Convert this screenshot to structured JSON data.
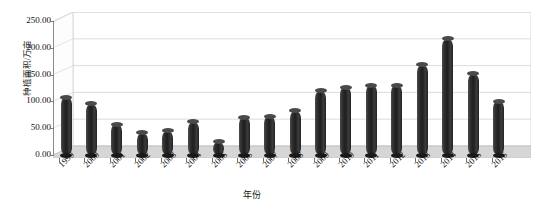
{
  "chart_data": {
    "type": "bar",
    "title": "",
    "xlabel": "年份",
    "ylabel": "种植面积/万亩",
    "categories": [
      "1999",
      "2000",
      "2001",
      "2002",
      "2003",
      "2004",
      "2005",
      "2006",
      "2007",
      "2008",
      "2009",
      "2010",
      "2011",
      "2012",
      "2013",
      "2014",
      "2015",
      "2016"
    ],
    "values": [
      108,
      96,
      57,
      42,
      45,
      62,
      25,
      70,
      72,
      82,
      120,
      126,
      130,
      130,
      168,
      217,
      152,
      100
    ],
    "ylim": [
      0,
      250
    ],
    "ytick_labels": [
      "0.00",
      "50.00",
      "100.00",
      "150.00",
      "200.00",
      "250.00"
    ],
    "ytick_values": [
      0,
      50,
      100,
      150,
      200,
      250
    ],
    "grid": true,
    "legend": "none",
    "style": "3d-cylinder-column",
    "series_color": "#262626"
  },
  "axes": {
    "y_title": "种植面积/万亩",
    "x_title": "年份"
  }
}
